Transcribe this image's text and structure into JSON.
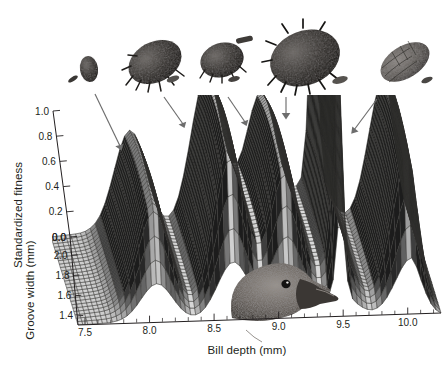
{
  "figure": {
    "name": "fitness-landscape-3d-surface",
    "background_color": "#ffffff",
    "ink_color": "#231f20",
    "mesh_color": "#4a4a4a",
    "arrow_color": "#6d6d6d"
  },
  "axes": {
    "x": {
      "label": "Bill depth (mm)",
      "ticks": [
        "7.5",
        "8.0",
        "8.5",
        "9.0",
        "9.5",
        "10.0"
      ],
      "tick_values": [
        7.5,
        8.0,
        8.5,
        9.0,
        9.5,
        10.0
      ],
      "range": [
        7.4,
        10.25
      ],
      "minor_step": 0.1
    },
    "y": {
      "label": "Groove width (mm)",
      "ticks": [
        "2.0",
        "1.8",
        "1.6",
        "1.4"
      ],
      "tick_values": [
        2.0,
        1.8,
        1.6,
        1.4
      ],
      "range": [
        2.05,
        1.32
      ],
      "reversed": true
    },
    "z": {
      "label": "Standardized fitness",
      "ticks": [
        "0.0",
        "0.2",
        "0.4",
        "0.6",
        "0.8",
        "1.0"
      ],
      "tick_values": [
        0.0,
        0.2,
        0.4,
        0.6,
        0.8,
        1.0
      ],
      "range": [
        0.0,
        1.0
      ]
    }
  },
  "chart_data": {
    "type": "surface",
    "title": "",
    "xlabel": "Bill depth (mm)",
    "ylabel": "Groove width (mm)",
    "zlabel": "Standardized fitness",
    "xlim": [
      7.4,
      10.25
    ],
    "ylim": [
      1.32,
      2.05
    ],
    "zlim": [
      0.0,
      1.0
    ],
    "grid": false,
    "legend": "none",
    "peaks": [
      {
        "index": 1,
        "bill_depth": 8.02,
        "groove_width": 1.72,
        "fitness": 0.45,
        "shape": "broad",
        "cone": "cone-1"
      },
      {
        "index": 2,
        "bill_depth": 8.62,
        "groove_width": 1.7,
        "fitness": 0.68,
        "shape": "broad",
        "cone": "cone-2"
      },
      {
        "index": 3,
        "bill_depth": 9.05,
        "groove_width": 1.7,
        "fitness": 0.6,
        "shape": "broad",
        "cone": "cone-3"
      },
      {
        "index": 4,
        "bill_depth": 9.46,
        "groove_width": 1.76,
        "fitness": 0.95,
        "shape": "sharp-spike",
        "cone": "cone-4"
      },
      {
        "index": 5,
        "bill_depth": 10.02,
        "groove_width": 1.72,
        "fitness": 0.66,
        "shape": "broad",
        "cone": "cone-5"
      }
    ],
    "valleys": [
      {
        "bill_depth": 7.6,
        "fitness": 0.02
      },
      {
        "bill_depth": 8.32,
        "fitness": 0.12
      },
      {
        "bill_depth": 8.85,
        "fitness": 0.38
      },
      {
        "bill_depth": 9.25,
        "fitness": 0.42
      },
      {
        "bill_depth": 9.75,
        "fitness": 0.2
      },
      {
        "bill_depth": 10.2,
        "fitness": 0.02
      }
    ]
  },
  "illustrations": {
    "cones": [
      {
        "id": "cone-1",
        "name": "conifer-cone-smallest",
        "size": "smallest",
        "has_seed": true,
        "bill_depth_target": 8.02
      },
      {
        "id": "cone-2",
        "name": "conifer-cone-small-open",
        "size": "small-open",
        "has_seed": true,
        "bill_depth_target": 8.62
      },
      {
        "id": "cone-3",
        "name": "conifer-cone-medium",
        "size": "medium",
        "has_seed": true,
        "bill_depth_target": 9.05
      },
      {
        "id": "cone-4",
        "name": "conifer-cone-large",
        "size": "large",
        "has_seed": true,
        "bill_depth_target": 9.46
      },
      {
        "id": "cone-5",
        "name": "conifer-cone-narrow-elongate",
        "size": "elongate",
        "has_seed": true,
        "bill_depth_target": 10.02
      }
    ],
    "bird": {
      "id": "bird-head",
      "name": "crossbill-head",
      "species_hint": "crossbill",
      "position_bill_depth": 9.2
    },
    "arrows": [
      {
        "id": "arrow-1",
        "from_cone": "cone-1",
        "to_peak": 1
      },
      {
        "id": "arrow-2",
        "from_cone": "cone-2",
        "to_peak": 2
      },
      {
        "id": "arrow-3",
        "from_cone": "cone-3",
        "to_peak": 3
      },
      {
        "id": "arrow-4",
        "from_cone": "cone-4",
        "to_peak": 4
      },
      {
        "id": "arrow-5",
        "from_cone": "cone-5",
        "to_peak": 5
      }
    ]
  }
}
